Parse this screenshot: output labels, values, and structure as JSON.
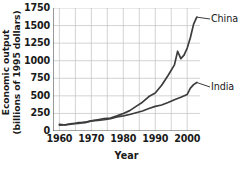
{
  "chart_data": {
    "type": "line",
    "title": "",
    "xlabel": "Year",
    "ylabel": "Economic output (billions of 1995 dollars)",
    "ylabel_line1": "Economic output",
    "ylabel_line2": "(billions of 1995 dollars)",
    "xlim": [
      1958,
      2004
    ],
    "ylim": [
      0,
      1750
    ],
    "xticks": [
      1960,
      1970,
      1980,
      1990,
      2000
    ],
    "yticks": [
      0,
      250,
      500,
      750,
      1000,
      1250,
      1500,
      1750
    ],
    "grid": true,
    "legend_position": "right-inline-labels",
    "line_color": "#3c3c3c",
    "grid_color": "#c8c8c8",
    "axis_color": "#555555",
    "series": [
      {
        "name": "China",
        "x": [
          1960,
          1962,
          1964,
          1966,
          1968,
          1970,
          1972,
          1974,
          1976,
          1978,
          1980,
          1982,
          1984,
          1986,
          1988,
          1990,
          1992,
          1994,
          1996,
          1997,
          1998,
          1999,
          2000,
          2001,
          2002,
          2003
        ],
        "values": [
          95,
          85,
          100,
          120,
          120,
          145,
          160,
          175,
          185,
          215,
          250,
          290,
          350,
          410,
          490,
          540,
          650,
          790,
          940,
          1135,
          1030,
          1080,
          1180,
          1330,
          1520,
          1620
        ]
      },
      {
        "name": "India",
        "x": [
          1960,
          1962,
          1964,
          1966,
          1968,
          1970,
          1972,
          1974,
          1976,
          1978,
          1980,
          1982,
          1984,
          1986,
          1988,
          1990,
          1992,
          1994,
          1996,
          1998,
          2000,
          2001,
          2002,
          2003
        ],
        "values": [
          85,
          92,
          105,
          108,
          125,
          145,
          150,
          160,
          175,
          200,
          215,
          235,
          260,
          285,
          320,
          350,
          370,
          405,
          445,
          480,
          520,
          610,
          660,
          690
        ]
      }
    ]
  },
  "labels": {
    "china": "China",
    "india": "India"
  }
}
